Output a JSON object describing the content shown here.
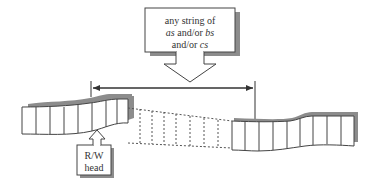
{
  "diagram": {
    "type": "turing-machine-tape",
    "callout": {
      "line1": "any string of",
      "line2_italic_a": "as",
      "line2_mid": " and/or ",
      "line2_italic_b": "bs",
      "line3_prefix": "and/or ",
      "line3_italic_c": "cs",
      "full_text": "any string of as and/or bs and/or cs"
    },
    "head": {
      "line1": "R/W",
      "line2": "head"
    },
    "span_arrow": {
      "from_x": 91,
      "to_x": 255,
      "y": 88,
      "direction": "both"
    },
    "tape": {
      "left_segment_cells": 10,
      "dashed_cells": 6,
      "right_segment_cells": 8
    },
    "colors": {
      "line": "#333333",
      "shadow": "#8c8c8c",
      "background": "#ffffff"
    }
  }
}
